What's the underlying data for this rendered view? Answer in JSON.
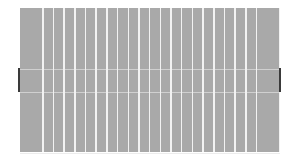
{
  "panel": {
    "strip_count": 22,
    "strips": [
      {
        "type": "wide"
      },
      {
        "type": "narrow"
      },
      {
        "type": "narrow"
      },
      {
        "type": "narrow"
      },
      {
        "type": "narrow"
      },
      {
        "type": "narrow"
      },
      {
        "type": "narrow"
      },
      {
        "type": "narrow"
      },
      {
        "type": "narrow"
      },
      {
        "type": "narrow"
      },
      {
        "type": "narrow"
      },
      {
        "type": "narrow"
      },
      {
        "type": "narrow"
      },
      {
        "type": "narrow"
      },
      {
        "type": "narrow"
      },
      {
        "type": "narrow"
      },
      {
        "type": "narrow"
      },
      {
        "type": "narrow"
      },
      {
        "type": "narrow"
      },
      {
        "type": "narrow"
      },
      {
        "type": "narrow"
      },
      {
        "type": "wide"
      }
    ],
    "colors": {
      "strip": "#a9a9a9",
      "gap": "#f2f2f2",
      "handle": "#3a3a3a",
      "background": "#ffffff"
    }
  },
  "handles": {
    "left": {
      "icon": "resize-handle-icon"
    },
    "right": {
      "icon": "resize-handle-icon"
    }
  }
}
